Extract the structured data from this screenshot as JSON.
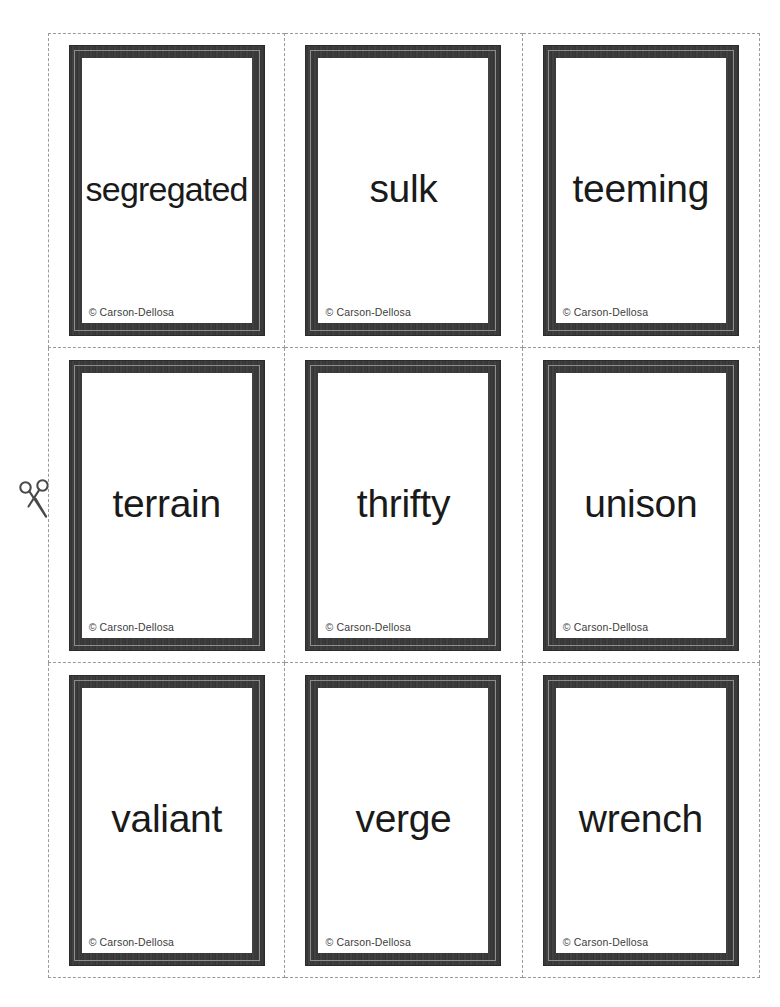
{
  "sheet": {
    "title": "Vocabulary Flashcards",
    "background_color": "#ffffff",
    "columns": 3,
    "rows": 3,
    "cut_line_color": "#9a9a9a",
    "frame_color": "#3a3a3a",
    "frame_bevel_color": "#8d8d8d"
  },
  "cut_marker": {
    "icon": "scissors-icon",
    "color": "#4a4a4a"
  },
  "copyright_text": "© Carson-Dellosa",
  "cards": [
    {
      "word": "segregated",
      "copyright": "© Carson-Dellosa",
      "row": 1,
      "column": 1
    },
    {
      "word": "sulk",
      "copyright": "© Carson-Dellosa",
      "row": 1,
      "column": 2
    },
    {
      "word": "teeming",
      "copyright": "© Carson-Dellosa",
      "row": 1,
      "column": 3
    },
    {
      "word": "terrain",
      "copyright": "© Carson-Dellosa",
      "row": 2,
      "column": 1
    },
    {
      "word": "thrifty",
      "copyright": "© Carson-Dellosa",
      "row": 2,
      "column": 2
    },
    {
      "word": "unison",
      "copyright": "© Carson-Dellosa",
      "row": 2,
      "column": 3
    },
    {
      "word": "valiant",
      "copyright": "© Carson-Dellosa",
      "row": 3,
      "column": 1
    },
    {
      "word": "verge",
      "copyright": "© Carson-Dellosa",
      "row": 3,
      "column": 2
    },
    {
      "word": "wrench",
      "copyright": "© Carson-Dellosa",
      "row": 3,
      "column": 3
    }
  ]
}
